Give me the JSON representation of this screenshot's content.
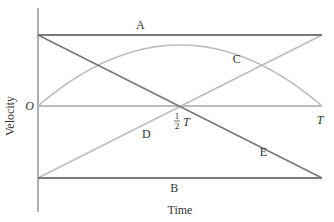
{
  "chart_data": {
    "type": "line",
    "title": "",
    "xlabel": "Time",
    "ylabel": "Velocity",
    "x_ticks": [
      {
        "t": 0,
        "label": "O"
      },
      {
        "t": 0.5,
        "label_num": "1",
        "label_den": "2",
        "label_var": "T"
      },
      {
        "t": 1,
        "label": "T"
      }
    ],
    "xlim": [
      0,
      1
    ],
    "ylim": [
      -1,
      1
    ],
    "series": [
      {
        "name": "A",
        "kind": "constant",
        "points": [
          [
            0,
            1
          ],
          [
            1,
            1
          ]
        ],
        "shade": "dark"
      },
      {
        "name": "B",
        "kind": "constant",
        "points": [
          [
            0,
            -1
          ],
          [
            1,
            -1
          ]
        ],
        "shade": "dark"
      },
      {
        "name": "C",
        "kind": "parabola",
        "peak": 0.86,
        "points": [
          [
            0,
            0
          ],
          [
            0.5,
            0.86
          ],
          [
            1,
            0
          ]
        ],
        "shade": "light"
      },
      {
        "name": "D",
        "kind": "linear",
        "points": [
          [
            0,
            -1
          ],
          [
            1,
            1
          ]
        ],
        "shade": "light"
      },
      {
        "name": "E",
        "kind": "linear",
        "points": [
          [
            0,
            1
          ],
          [
            1,
            -1
          ]
        ],
        "shade": "dark"
      }
    ],
    "colors": {
      "dark": "#7a7a7a",
      "light": "#bdbdbd",
      "axis": "#7a7a7a",
      "text": "#333333"
    }
  }
}
